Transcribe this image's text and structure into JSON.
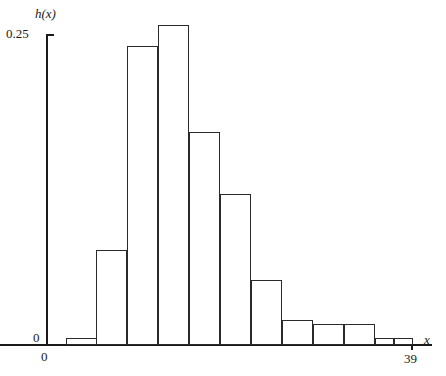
{
  "chart_data": {
    "type": "bar",
    "title": "",
    "subtitle": "",
    "xlabel": "x",
    "ylabel": "h(x)",
    "grid": false,
    "legend": null,
    "xlim": [
      0,
      39
    ],
    "ylim": [
      0,
      0.25
    ],
    "x_tick_labels": [
      "0",
      "39"
    ],
    "y_tick_labels": [
      "0",
      "0.25"
    ],
    "y_ticks": [
      0,
      0.25
    ],
    "x_ticks": [
      0,
      39
    ],
    "bin_width": 2.5,
    "categories": [
      "1.5-4.0",
      "4.0-6.5",
      "6.5-9.0",
      "9.0-11.5",
      "11.5-14.0",
      "14.0-16.5",
      "16.5-19.0",
      "19.0-21.5",
      "21.5-24.0",
      "24.0-26.5",
      "26.5-28.0",
      "28.0-39.0"
    ],
    "values": [
      0.006,
      0.076,
      0.24,
      0.257,
      0.171,
      0.121,
      0.052,
      0.02,
      0.017,
      0.017,
      0.006,
      0.006
    ],
    "bars": [
      {
        "name": "bar-1",
        "x": 66,
        "width": 31,
        "value": 0.006
      },
      {
        "name": "bar-2",
        "x": 96,
        "width": 31,
        "value": 0.076
      },
      {
        "name": "bar-3",
        "x": 127,
        "width": 31,
        "value": 0.24
      },
      {
        "name": "bar-4",
        "x": 158,
        "width": 31,
        "value": 0.257
      },
      {
        "name": "bar-5",
        "x": 189,
        "width": 31,
        "value": 0.171
      },
      {
        "name": "bar-6",
        "x": 220,
        "width": 31,
        "value": 0.121
      },
      {
        "name": "bar-7",
        "x": 251,
        "width": 31,
        "value": 0.052
      },
      {
        "name": "bar-8",
        "x": 282,
        "width": 31,
        "value": 0.02
      },
      {
        "name": "bar-9",
        "x": 313,
        "width": 31,
        "value": 0.017
      },
      {
        "name": "bar-10",
        "x": 344,
        "width": 31,
        "value": 0.017
      },
      {
        "name": "bar-11",
        "x": 375,
        "width": 19,
        "value": 0.006
      },
      {
        "name": "bar-12",
        "x": 394,
        "width": 19,
        "value": 0.006
      }
    ],
    "colors": {
      "bar_fill": "#ffffff",
      "bar_stroke": "#2a2a2a",
      "axis": "#1a1a1a",
      "background": "#ffffff",
      "text": "#1a1a1a"
    },
    "geometry": {
      "baseline_y": 345,
      "y_axis_x": 47,
      "y_top_px": 34,
      "y_top_value": 0.25
    }
  }
}
